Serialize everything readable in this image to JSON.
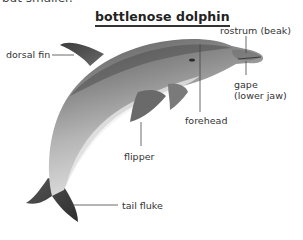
{
  "header": {
    "cutoff_text": "but smaller.",
    "title": "bottlenose dolphin"
  },
  "labels": {
    "dorsal_fin": "dorsal fin",
    "rostrum": "rostrum (beak)",
    "gape_line1": "gape",
    "gape_line2": "(lower jaw)",
    "forehead": "forehead",
    "flipper": "flipper",
    "tail_fluke": "tail fluke"
  },
  "colors": {
    "text": "#333333",
    "leader_line": "#444444",
    "body_dark": "#4a4a4a",
    "body_mid": "#8a8a8a",
    "belly": "#e6e6e6"
  }
}
